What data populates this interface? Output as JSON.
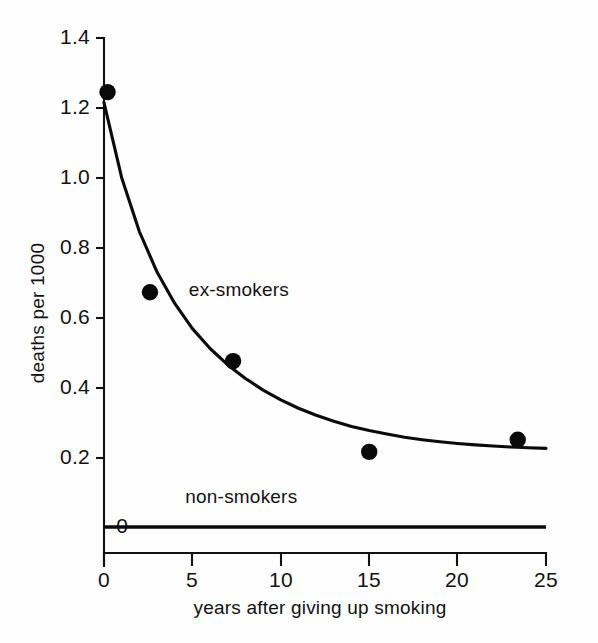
{
  "chart_data": {
    "type": "scatter",
    "title": "",
    "xlabel": "years after giving up smoking",
    "ylabel": "deaths per 1000",
    "xlim": [
      0,
      25
    ],
    "ylim": [
      0,
      1.4
    ],
    "grid": false,
    "legend_position": "inline-annotation",
    "x_ticks": [
      "0",
      "5",
      "10",
      "15",
      "20",
      "25"
    ],
    "x_tick_values": [
      0,
      5,
      10,
      15,
      20,
      25
    ],
    "y_ticks": [
      "0",
      "0.2",
      "0.4",
      "0.6",
      "0.8",
      "1.0",
      "1.2",
      "1.4"
    ],
    "y_tick_values": [
      0,
      0.2,
      0.4,
      0.6,
      0.8,
      1.0,
      1.2,
      1.4
    ],
    "series": [
      {
        "name": "ex-smokers",
        "annotation": "ex-smokers",
        "annotation_x": 4.8,
        "annotation_y": 0.675,
        "marker": "filled-circle",
        "points": [
          {
            "x": 0.2,
            "y": 1.245
          },
          {
            "x": 2.6,
            "y": 0.672
          },
          {
            "x": 7.3,
            "y": 0.475
          },
          {
            "x": 15.0,
            "y": 0.215
          },
          {
            "x": 23.4,
            "y": 0.25
          }
        ],
        "fitted_curve": {
          "description": "decaying exponential fit through ex-smoker points",
          "x": [
            0.0,
            1.0,
            2.0,
            3.0,
            4.0,
            5.0,
            6.0,
            7.0,
            8.0,
            9.0,
            10.0,
            11.0,
            12.0,
            13.0,
            14.0,
            15.0,
            16.0,
            17.0,
            18.0,
            19.0,
            20.0,
            21.0,
            22.0,
            23.0,
            24.0,
            25.0
          ],
          "y": [
            1.215,
            1.0,
            0.846,
            0.73,
            0.64,
            0.568,
            0.511,
            0.464,
            0.425,
            0.392,
            0.364,
            0.34,
            0.32,
            0.303,
            0.288,
            0.276,
            0.266,
            0.257,
            0.25,
            0.244,
            0.239,
            0.235,
            0.232,
            0.229,
            0.227,
            0.225
          ]
        }
      },
      {
        "name": "non-smokers",
        "annotation": "non-smokers",
        "annotation_x": 4.6,
        "annotation_y": 0.083,
        "marker": "none",
        "constant_value": 0.0,
        "points": [
          {
            "x": 0,
            "y": 0.0
          },
          {
            "x": 25,
            "y": 0.0
          }
        ]
      }
    ]
  },
  "colors": {
    "ink": "#0a0a0a",
    "background": "#fefefe",
    "axis": "#111111"
  }
}
